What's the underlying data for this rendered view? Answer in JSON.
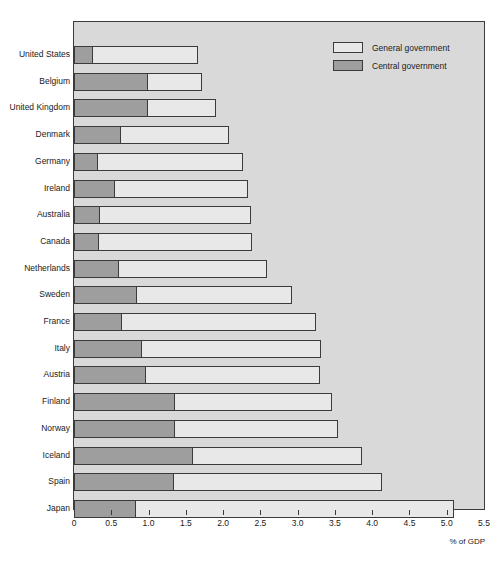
{
  "chart_data": {
    "type": "bar",
    "orientation": "horizontal",
    "title": "",
    "xlabel": "% of GDP",
    "ylabel": "",
    "xlim": [
      0,
      5.5
    ],
    "xticks": [
      "0",
      "0.5",
      "1.0",
      "1.5",
      "2.0",
      "2.5",
      "3.0",
      "3.5",
      "4.0",
      "4.5",
      "5.0",
      "5.5"
    ],
    "xtick_values": [
      0,
      0.5,
      1.0,
      1.5,
      2.0,
      2.5,
      3.0,
      3.5,
      4.0,
      4.5,
      5.0,
      5.5
    ],
    "grid": false,
    "legend_position": "top-right",
    "categories": [
      "United States",
      "Belgium",
      "United Kingdom",
      "Denmark",
      "Germany",
      "Ireland",
      "Australia",
      "Canada",
      "Netherlands",
      "Sweden",
      "France",
      "Italy",
      "Austria",
      "Finland",
      "Norway",
      "Iceland",
      "Spain",
      "Japan"
    ],
    "series": [
      {
        "name": "General government",
        "color": "#e8e8e8",
        "values": [
          1.67,
          1.72,
          1.9,
          2.08,
          2.27,
          2.34,
          2.38,
          2.39,
          2.59,
          2.92,
          3.24,
          3.32,
          3.3,
          3.46,
          3.54,
          3.86,
          4.13,
          5.1
        ]
      },
      {
        "name": "Central government",
        "color": "#9e9e9e",
        "values": [
          0.25,
          0.99,
          0.99,
          0.63,
          0.32,
          0.55,
          0.35,
          0.34,
          0.61,
          0.85,
          0.64,
          0.91,
          0.96,
          1.36,
          1.36,
          1.59,
          1.34,
          0.83
        ]
      }
    ]
  },
  "legend": {
    "items": [
      {
        "label": "General government",
        "swatch": "general"
      },
      {
        "label": "Central government",
        "swatch": "central"
      }
    ]
  },
  "axis": {
    "x_title": "% of GDP"
  }
}
